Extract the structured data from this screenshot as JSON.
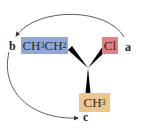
{
  "diagram": {
    "type": "stereochemistry-priority-rotation",
    "center": "C",
    "groups": [
      {
        "id": "ethyl",
        "main": "CH",
        "sub1": "3",
        "main2": "CH",
        "sub2": "2",
        "priority_label": "b",
        "color": "#8FA8D8"
      },
      {
        "id": "chloro",
        "main": "Cl",
        "priority_label": "a",
        "color": "#E08080"
      },
      {
        "id": "methyl",
        "main": "CH",
        "sub1": "3",
        "priority_label": "c",
        "color": "#EDC58E"
      }
    ],
    "arrows": [
      {
        "from": "a",
        "to": "b"
      },
      {
        "from": "b",
        "to": "c"
      }
    ],
    "colors": {
      "ethyl_box": "#8FA8D8",
      "chloro_box": "#E08080",
      "methyl_box": "#EDC58E",
      "bond": "#000000",
      "arrow": "#333333"
    }
  }
}
